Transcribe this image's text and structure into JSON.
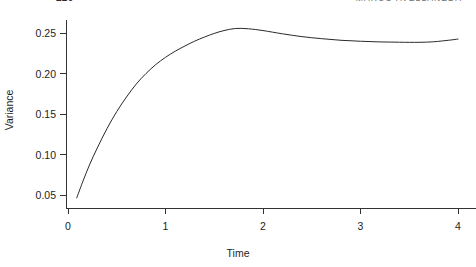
{
  "page_header": {
    "left_text": "220",
    "right_text": "MARCO AVELLANEDA",
    "clipped": true
  },
  "chart_data": {
    "type": "line",
    "title": "",
    "subtitle": "",
    "xlabel": "Time",
    "ylabel": "Variance",
    "xlim": [
      0,
      4
    ],
    "ylim": [
      0.035,
      0.262
    ],
    "xticks": [
      "0",
      "1",
      "2",
      "3",
      "4"
    ],
    "xtick_values": [
      0,
      1,
      2,
      3,
      4
    ],
    "yticks": [
      "0.05",
      "0.10",
      "0.15",
      "0.20",
      "0.25"
    ],
    "ytick_values": [
      0.05,
      0.1,
      0.15,
      0.2,
      0.25
    ],
    "grid": false,
    "legend": null,
    "line_color": "#2a2a2a",
    "line_width": 1.0,
    "series": [
      {
        "name": "Variance",
        "x": [
          0.09,
          0.15,
          0.22,
          0.3,
          0.4,
          0.5,
          0.6,
          0.7,
          0.8,
          0.9,
          1.0,
          1.1,
          1.2,
          1.3,
          1.4,
          1.5,
          1.6,
          1.72,
          1.85,
          2.0,
          2.2,
          2.4,
          2.6,
          2.8,
          3.0,
          3.2,
          3.4,
          3.6,
          3.75,
          3.9,
          4.0
        ],
        "y": [
          0.0465,
          0.066,
          0.087,
          0.108,
          0.132,
          0.153,
          0.171,
          0.187,
          0.2,
          0.211,
          0.22,
          0.2275,
          0.234,
          0.24,
          0.245,
          0.2495,
          0.253,
          0.2556,
          0.2552,
          0.253,
          0.249,
          0.2455,
          0.243,
          0.241,
          0.2398,
          0.239,
          0.2386,
          0.2385,
          0.2392,
          0.241,
          0.2425
        ]
      }
    ],
    "annotations": []
  }
}
